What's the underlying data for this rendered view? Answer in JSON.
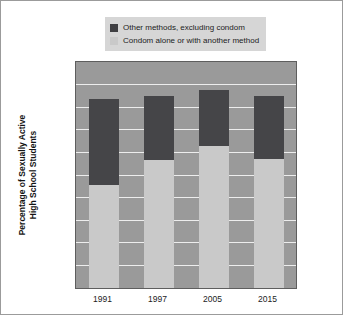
{
  "chart_data": {
    "type": "bar",
    "subtype": "stacked",
    "title": "",
    "xlabel": "",
    "ylabel": "Percentage of Sexually Active High School Students",
    "ylabel_lines": [
      "Percentage of Sexually Active",
      "High School Students"
    ],
    "categories": [
      "1991",
      "1997",
      "2005",
      "2015"
    ],
    "ylim": [
      0,
      100
    ],
    "yticks": [
      0,
      10,
      20,
      30,
      40,
      50,
      60,
      70,
      80,
      90,
      100
    ],
    "ytick_labels": [
      "0",
      "10",
      "20",
      "30",
      "40",
      "50",
      "60",
      "70",
      "80",
      "90",
      "100"
    ],
    "grid": true,
    "legend_position": "top",
    "series": [
      {
        "name": "Condom alone or with another method",
        "color": "#c9c9c9",
        "values": [
          45.5,
          56.8,
          62.8,
          56.9
        ]
      },
      {
        "name": "Other methods, excluding condom",
        "color": "#454548",
        "values": [
          38.3,
          28.2,
          24.9,
          28.2
        ]
      }
    ],
    "totals": [
      83.8,
      85.0,
      87.7,
      85.1
    ]
  },
  "legend": {
    "items": [
      {
        "label": "Other methods, excluding condom",
        "swatch": "dark"
      },
      {
        "label": "Condom alone or with another method",
        "swatch": "light"
      }
    ]
  },
  "colors": {
    "dark_segment": "#454548",
    "light_segment": "#c9c9c9",
    "plot_background": "#9a9a9a",
    "gridline": "#ededed",
    "legend_background": "#d6d6d6",
    "figure_background": "#ffffff",
    "border": "#9b9b9b"
  }
}
